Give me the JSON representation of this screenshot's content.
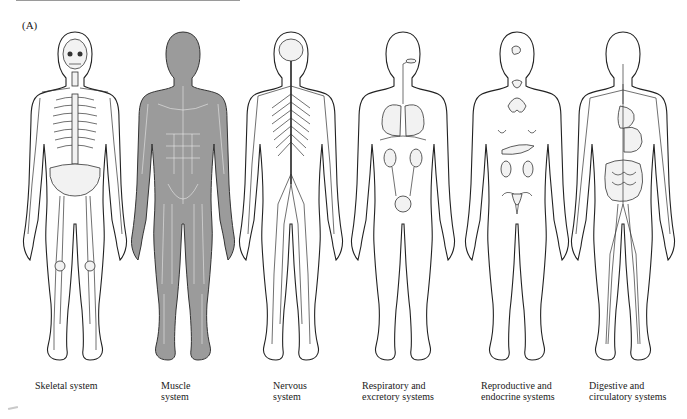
{
  "figure": {
    "panel_label": "(A)",
    "systems": [
      {
        "id": "skeletal",
        "caption": "Skeletal system"
      },
      {
        "id": "muscle",
        "caption": "Muscle\nsystem"
      },
      {
        "id": "nervous",
        "caption": "Nervous\nsystem"
      },
      {
        "id": "respiratory-excretory",
        "caption": "Respiratory and\nexcretory systems"
      },
      {
        "id": "reproductive-endocrine",
        "caption": "Reproductive and\nendocrine systems"
      },
      {
        "id": "digestive-circulatory",
        "caption": "Digestive and\ncirculatory systems"
      }
    ]
  }
}
